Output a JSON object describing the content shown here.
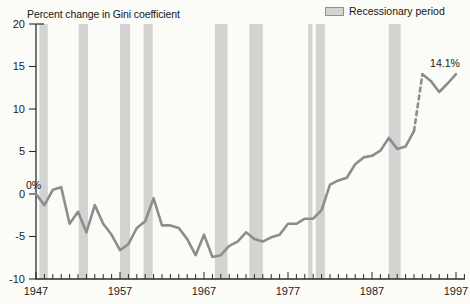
{
  "figure": {
    "title": "Percent change in Gini coefficient",
    "legend_label": "Recessionary period"
  },
  "chart_data": {
    "type": "line",
    "title": "Percent change in Gini coefficient",
    "x_start_year": 1947,
    "x": [
      1947,
      1948,
      1949,
      1950,
      1951,
      1952,
      1953,
      1954,
      1955,
      1956,
      1957,
      1958,
      1959,
      1960,
      1961,
      1962,
      1963,
      1964,
      1965,
      1966,
      1967,
      1968,
      1969,
      1970,
      1971,
      1972,
      1973,
      1974,
      1975,
      1976,
      1977,
      1978,
      1979,
      1980,
      1981,
      1982,
      1983,
      1984,
      1985,
      1986,
      1987,
      1988,
      1989,
      1990,
      1991,
      1992,
      1993,
      1994,
      1995,
      1996,
      1997
    ],
    "values": [
      0.0,
      -1.3,
      0.5,
      0.8,
      -3.5,
      -2.1,
      -4.5,
      -1.3,
      -3.5,
      -4.8,
      -6.6,
      -5.9,
      -4.0,
      -3.2,
      -0.5,
      -3.7,
      -3.7,
      -4.0,
      -5.3,
      -7.2,
      -4.8,
      -7.4,
      -7.2,
      -6.1,
      -5.6,
      -4.5,
      -5.3,
      -5.6,
      -5.1,
      -4.8,
      -3.5,
      -3.5,
      -2.9,
      -2.9,
      -1.9,
      1.1,
      1.6,
      1.9,
      3.5,
      4.3,
      4.5,
      5.1,
      6.6,
      5.3,
      5.6,
      7.4,
      14.1,
      13.3,
      12.0,
      13.0,
      14.1
    ],
    "dashed_segment_years": [
      1992,
      1993
    ],
    "ylim": [
      -10,
      20
    ],
    "yticks": [
      20,
      15,
      10,
      5,
      0,
      -5,
      -10
    ],
    "xticks_labeled": [
      1947,
      1957,
      1967,
      1977,
      1987,
      1997
    ],
    "xticks_minor_every": 1,
    "x_axis_end_year": 1998,
    "grid": false,
    "legend": "Recessionary period",
    "legend_position": "top-right",
    "recession_bars": [
      [
        1947.4,
        1948.4
      ],
      [
        1952.1,
        1953.2
      ],
      [
        1957.0,
        1958.2
      ],
      [
        1959.8,
        1960.9
      ],
      [
        1968.3,
        1969.8
      ],
      [
        1972.4,
        1974.0
      ],
      [
        1979.4,
        1979.9
      ],
      [
        1980.3,
        1981.4
      ],
      [
        1989.0,
        1990.4
      ]
    ],
    "annotations": [
      {
        "text": "0%",
        "year": 1947,
        "value": 0,
        "dx": -10,
        "dy": -5,
        "anchor": "start"
      },
      {
        "text": "14.1%",
        "year": 1997,
        "value": 14.1,
        "dx": -11,
        "dy": -7,
        "anchor": "middle"
      }
    ],
    "line_color": "#8d8d8d",
    "bar_color": "#d3d3d1",
    "axis_color": "#2b2b2b",
    "label_color": "#1d1d1d"
  }
}
